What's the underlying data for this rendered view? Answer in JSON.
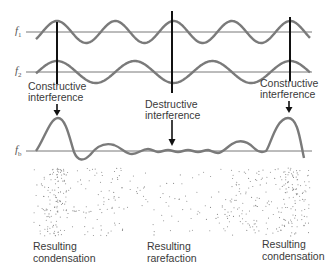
{
  "waves": {
    "f1_label": "f",
    "f1_sub": "1",
    "f2_label": "f",
    "f2_sub": "2",
    "fb_label": "f",
    "fb_sub": "b"
  },
  "annotations": {
    "left": {
      "line1": "Constructive",
      "line2": "interference"
    },
    "middle": {
      "line1": "Destructive",
      "line2": "interference"
    },
    "right": {
      "line1": "Constructive",
      "line2": "interference"
    }
  },
  "results": {
    "left": {
      "line1": "Resulting",
      "line2": "condensation"
    },
    "middle": {
      "line1": "Resulting",
      "line2": "rarefaction"
    },
    "right": {
      "line1": "Resulting",
      "line2": "condensation"
    }
  },
  "colors": {
    "wave": "#7a7a7a",
    "axis": "#555555",
    "marker": "#111111",
    "dots": "#8a8a8a"
  }
}
